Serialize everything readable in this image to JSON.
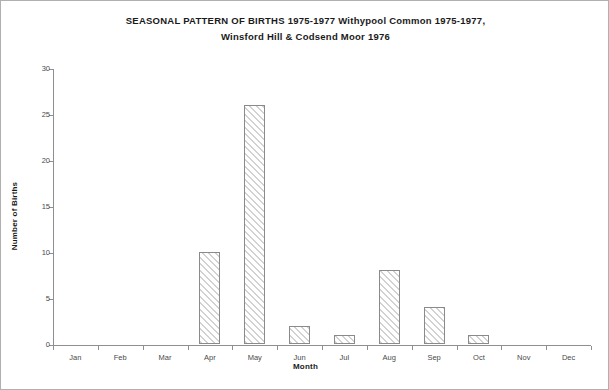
{
  "chart_data": {
    "type": "bar",
    "title": "SEASONAL PATTERN OF BIRTHS 1975-1977 Withypool Common 1975-1977, Winsford Hill & Codsend Moor 1976",
    "title_lines": [
      "SEASONAL PATTERN OF BIRTHS 1975-1977 Withypool Common 1975-1977,",
      "Winsford Hill & Codsend Moor 1976"
    ],
    "xlabel": "Month",
    "ylabel": "Number of Births",
    "categories": [
      "Jan",
      "Feb",
      "Mar",
      "Apr",
      "May",
      "Jun",
      "Jul",
      "Aug",
      "Sep",
      "Oct",
      "Nov",
      "Dec"
    ],
    "values": [
      0,
      0,
      0,
      10,
      26,
      2,
      1,
      8,
      4,
      1,
      0,
      0
    ],
    "ylim": [
      0,
      30
    ],
    "yticks": [
      0,
      5,
      10,
      15,
      20,
      25,
      30
    ],
    "ytick_labels": [
      "0",
      "5",
      "10",
      "15",
      "20",
      "25",
      "30"
    ],
    "grid": false,
    "legend": null,
    "bar_fill": "diagonal-hatch",
    "colors": {
      "bar_edge": "#8a8a8a",
      "bar_hatch": "#d2d2d2",
      "axis": "#8f8f8f",
      "text": "#1a1a1a",
      "tick_text": "#4a4a4a",
      "background": "#ffffff",
      "frame": "#b0b0b0"
    }
  }
}
